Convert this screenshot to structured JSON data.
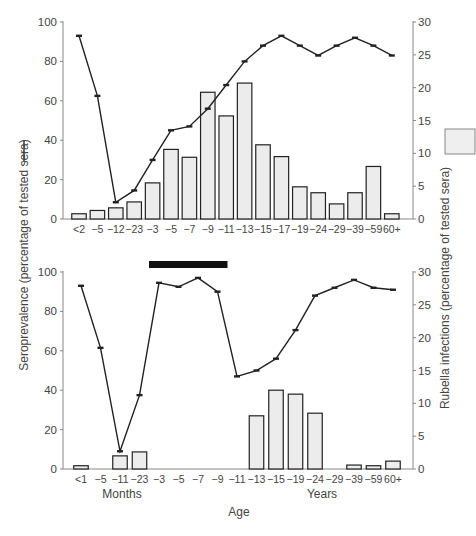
{
  "figure": {
    "xlabel": "Age",
    "left_ylabel": "Seroprevalence (percentage of tested sera)",
    "right_ylabel": "Rubella infections (percentage of tested sera)",
    "legend": {
      "line_symbol": "line-legend-swatch",
      "bar_symbol": "bar-legend-swatch"
    },
    "colors": {
      "bar_fill": "#ececec",
      "bar_stroke": "#222222",
      "line": "#222222",
      "axis": "#888888",
      "period_bar": "#111111"
    }
  },
  "chart_data": [
    {
      "type": "bar+line",
      "panel": "top",
      "categories": [
        "<2",
        "−5",
        "−12",
        "−23",
        "−3",
        "−5",
        "−7",
        "−9",
        "−11",
        "−13",
        "−15",
        "−17",
        "−19",
        "−24",
        "−29",
        "−39",
        "−59",
        "60+"
      ],
      "series": [
        {
          "name": "Seroprevalence",
          "type": "line",
          "axis": "left",
          "values": [
            93,
            62.5,
            8.5,
            14.5,
            30,
            45,
            47,
            56,
            68,
            80,
            88,
            93,
            88,
            83,
            88,
            92,
            88,
            83
          ]
        },
        {
          "name": "Rubella infections",
          "type": "bar",
          "axis": "right",
          "values": [
            0.8,
            1.3,
            1.7,
            2.6,
            5.5,
            10.6,
            9.4,
            19.3,
            15.7,
            20.7,
            11.3,
            9.5,
            4.9,
            4.0,
            2.3,
            4.0,
            8.0,
            0.8
          ]
        }
      ],
      "left_ylim": [
        0,
        100
      ],
      "left_yticks": [
        0,
        20,
        40,
        60,
        80,
        100
      ],
      "right_ylim": [
        0,
        30
      ],
      "right_yticks": [
        0,
        5,
        10,
        15,
        20,
        25,
        30
      ],
      "grid": false
    },
    {
      "type": "bar+line",
      "panel": "bottom",
      "categories": [
        "<1",
        "−5",
        "−11",
        "−23",
        "−3",
        "−5",
        "−7",
        "−9",
        "−11",
        "−13",
        "−15",
        "−19",
        "−24",
        "−29",
        "−39",
        "−59",
        "60+"
      ],
      "group_labels": {
        "months": "Months",
        "years": "Years"
      },
      "series": [
        {
          "name": "Seroprevalence",
          "type": "line",
          "axis": "left",
          "values": [
            93,
            61.5,
            9,
            37.5,
            94.5,
            92.5,
            97,
            90,
            47,
            50,
            56,
            70.5,
            88,
            92,
            96,
            92,
            91
          ]
        },
        {
          "name": "Rubella infections",
          "type": "bar",
          "axis": "right",
          "values": [
            0.5,
            0,
            2.0,
            2.6,
            0,
            0,
            0,
            0,
            0,
            8.1,
            12.0,
            11.4,
            8.5,
            0,
            0.6,
            0.5,
            1.2
          ]
        }
      ],
      "annotation": {
        "type": "horizontal-bar",
        "from_category": 4,
        "to_category": 7
      },
      "left_ylim": [
        0,
        100
      ],
      "left_yticks": [
        0,
        20,
        40,
        60,
        80,
        100
      ],
      "right_ylim": [
        0,
        30
      ],
      "right_yticks": [
        0,
        5,
        10,
        15,
        20,
        25,
        30
      ],
      "grid": false
    }
  ]
}
